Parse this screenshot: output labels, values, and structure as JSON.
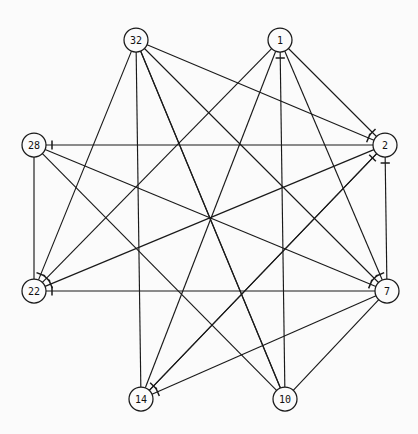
{
  "diagram": {
    "type": "node-link-graph",
    "width": 418,
    "height": 434,
    "background_color": "#fbfbfb",
    "edge_color": "#1a1a1a",
    "node_fill": "#fbfbfb",
    "node_stroke": "#1a1a1a",
    "node_radius": 12,
    "nodes": [
      {
        "id": "32",
        "label": "32",
        "x": 136,
        "y": 40
      },
      {
        "id": "1",
        "label": "1",
        "x": 280,
        "y": 40
      },
      {
        "id": "2",
        "label": "2",
        "x": 385,
        "y": 145
      },
      {
        "id": "7",
        "label": "7",
        "x": 387,
        "y": 291
      },
      {
        "id": "10",
        "label": "10",
        "x": 285,
        "y": 399
      },
      {
        "id": "14",
        "label": "14",
        "x": 141,
        "y": 399
      },
      {
        "id": "22",
        "label": "22",
        "x": 34,
        "y": 291
      },
      {
        "id": "28",
        "label": "28",
        "x": 34,
        "y": 145
      }
    ],
    "edges": [
      {
        "from": "32",
        "to": "14",
        "arrow": false
      },
      {
        "from": "32",
        "to": "2",
        "arrow": true
      },
      {
        "from": "32",
        "to": "7",
        "arrow": true
      },
      {
        "from": "32",
        "to": "10",
        "arrow": false
      },
      {
        "from": "32",
        "to": "22",
        "arrow": true
      },
      {
        "from": "1",
        "to": "22",
        "arrow": true
      },
      {
        "from": "1",
        "to": "14",
        "arrow": false
      },
      {
        "from": "1",
        "to": "7",
        "arrow": true
      },
      {
        "from": "1",
        "to": "2",
        "arrow": true
      },
      {
        "from": "10",
        "to": "1",
        "arrow": true
      },
      {
        "from": "28",
        "to": "22",
        "arrow": false
      },
      {
        "from": "28",
        "to": "7",
        "arrow": true
      },
      {
        "from": "28",
        "to": "10",
        "arrow": false
      },
      {
        "from": "2",
        "to": "28",
        "arrow": true
      },
      {
        "from": "2",
        "to": "22",
        "arrow": true
      },
      {
        "from": "2",
        "to": "14",
        "arrow": true
      },
      {
        "from": "7",
        "to": "2",
        "arrow": true
      },
      {
        "from": "7",
        "to": "22",
        "arrow": true
      },
      {
        "from": "7",
        "to": "14",
        "arrow": true
      },
      {
        "from": "7",
        "to": "10",
        "arrow": false
      },
      {
        "from": "10",
        "to": "32",
        "arrow": false
      },
      {
        "from": "14",
        "to": "2",
        "arrow": true
      }
    ]
  }
}
